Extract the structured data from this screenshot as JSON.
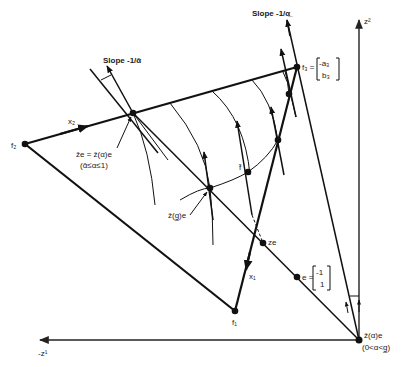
{
  "figure": {
    "axes": {
      "vertical_label": "z²",
      "horizontal_label": "-z¹"
    },
    "labels": {
      "slope_top_left": "Slope -1/ᾱ",
      "slope_top_right": "Slope -1/α̲",
      "f1": "f₁",
      "f2": "f₂",
      "f3": "f₃ =",
      "f3_matrix_top": "-a₃",
      "f3_matrix_bottom": "b₃",
      "x1": "x₁",
      "x2": "x₂",
      "ze": "ze",
      "e": "e =",
      "e_matrix_top": "-1",
      "e_matrix_bottom": "1",
      "f": "f̂",
      "zbar_e_line1": "z̄e = ẑ(α)e",
      "zbar_e_line2": "(ᾱ≤α≤1)",
      "zhat_g_e": "ẑ(g̲)e",
      "origin_line1": "ẑ(α)e",
      "origin_line2": "(0<α<g̲)"
    },
    "points": {
      "origin": [
        359,
        340
      ],
      "f1": [
        235,
        311
      ],
      "f2": [
        25,
        144
      ],
      "f3": [
        297,
        67
      ],
      "zbar_e": [
        133,
        113
      ],
      "ze": [
        263,
        243
      ],
      "e": [
        297,
        277
      ],
      "zhat_g": [
        210,
        188
      ],
      "f_hat": [
        248,
        172
      ],
      "mid_f1f3": [
        278,
        140
      ],
      "upper_f1f3": [
        289,
        94
      ]
    }
  }
}
